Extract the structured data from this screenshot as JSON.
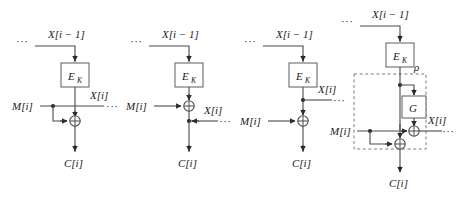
{
  "figure": {
    "background_color": "#ffffff",
    "wire_color": "#4a4a4a",
    "box_stroke_color": "#6b6b6b",
    "text_color": "#1a1a1a",
    "panel_count": 4
  },
  "labels": {
    "x_prev": "X[i − 1]",
    "x_cur": "X[i]",
    "message": "M[i]",
    "cipher": "C[i]",
    "cipher_block": "E",
    "cipher_block_sub": "K",
    "g_block": "G",
    "rho": "ρ",
    "ellipsis": "···",
    "xor": "⊕"
  },
  "panels": [
    {
      "id": "panel-1",
      "name": "variant-a",
      "x_prev_label": "X[i − 1]",
      "x_cur_label": "X[i]",
      "message_label": "M[i]",
      "cipher_label": "C[i]",
      "block_label": "E",
      "block_sub": "K",
      "tap_point": "message-line",
      "description": "X[i] taken from the M[i] input line; M[i] branches down into XOR with E_K output"
    },
    {
      "id": "panel-2",
      "name": "variant-b",
      "x_prev_label": "X[i − 1]",
      "x_cur_label": "X[i]",
      "message_label": "M[i]",
      "cipher_label": "C[i]",
      "block_label": "E",
      "block_sub": "K",
      "tap_point": "below-xor",
      "description": "M[i] feeds XOR directly; X[i] tapped from C[i] line below the XOR"
    },
    {
      "id": "panel-3",
      "name": "variant-c",
      "x_prev_label": "X[i − 1]",
      "x_cur_label": "X[i]",
      "message_label": "M[i]",
      "cipher_label": "C[i]",
      "block_label": "E",
      "block_sub": "K",
      "tap_point": "above-xor",
      "description": "M[i] feeds XOR directly; X[i] tapped from E_K output above the XOR"
    },
    {
      "id": "panel-4",
      "name": "variant-rho",
      "x_prev_label": "X[i − 1]",
      "x_cur_label": "X[i]",
      "message_label": "M[i]",
      "cipher_label": "C[i]",
      "block_label": "E",
      "block_sub": "K",
      "g_label": "G",
      "rho_label": "ρ",
      "tap_point": "g-xor",
      "description": "E_K output branches into G; G output XORed with M[i] to give X[i]; M[i] also XORed into main line to give C[i]; dashed region labelled rho"
    }
  ]
}
